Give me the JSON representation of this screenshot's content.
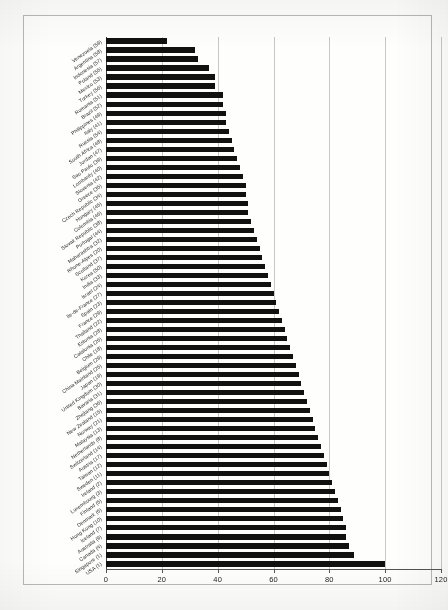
{
  "chart_data": {
    "type": "bar",
    "orientation": "horizontal",
    "title": "",
    "subtitle": "",
    "xlabel": "",
    "ylabel": "",
    "xlim": [
      0,
      120
    ],
    "xticks": [
      0,
      20,
      40,
      60,
      80,
      100,
      120
    ],
    "xticklabels": [
      "0",
      "20",
      "40",
      "60",
      "80",
      "100",
      "120"
    ],
    "grid": true,
    "grid_axis": "x",
    "legend": false,
    "bar_color": "#111110",
    "note": "Index scale, USA = 100. Labels show region name followed by its rank in parentheses.",
    "categories": [
      "Venezuela (59)",
      "Argentina (58)",
      "Indonesia (57)",
      "Poland (55)",
      "Mexico (53)",
      "Turkey (56)",
      "Romania (51)",
      "Brazil (52)",
      "Philippines (49)",
      "Italy (41)",
      "Russia (54)",
      "South Africa (48)",
      "Jordan (47)",
      "Sao Paulo (39)",
      "Lombardy (40)",
      "Slovenia (42)",
      "Greece (35)",
      "Czech Republic (34)",
      "Hungary (45)",
      "Colombia (46)",
      "Slovak Republic (38)",
      "Portugal (44)",
      "Maharashtra (32)",
      "Rhone-Alpes (20)",
      "Scotland (37)",
      "Korea (50)",
      "India (33)",
      "Israel (24)",
      "Ile-de-France (27)",
      "Spain (23)",
      "France (29)",
      "Thailand (22)",
      "Estonia (28)",
      "Catalonia (26)",
      "Chile (18)",
      "Belgium (29)",
      "China Mainland (25)",
      "Japan (19)",
      "United Kingdom (30)",
      "Bavaria (31)",
      "Zhejiang (36)",
      "New Zealand (15)",
      "Norway (21)",
      "Malaysia (13)",
      "Netherlands (8)",
      "Switzerland (14)",
      "Austria (17)",
      "Taiwan (12)",
      "Sweden (11)",
      "Ireland (2)",
      "Luxembourg (3)",
      "Finland (5)",
      "Denmark (6)",
      "Hong Kong (10)",
      "Iceland (7)",
      "Australia (9)",
      "Canada (4)",
      "Singapore (1)",
      "USA (1)"
    ],
    "values": [
      22,
      32,
      33,
      37,
      39,
      39,
      42,
      42,
      43,
      43,
      44,
      45,
      46,
      47,
      48,
      49,
      50,
      50,
      51,
      51,
      52,
      53,
      54,
      55,
      56,
      57,
      58,
      59,
      60,
      61,
      62,
      63,
      64,
      65,
      66,
      67,
      68,
      69,
      70,
      71,
      72,
      73,
      74,
      75,
      76,
      77,
      78,
      79,
      80,
      81,
      82,
      83,
      84,
      85,
      86,
      86,
      87,
      89,
      100
    ]
  }
}
